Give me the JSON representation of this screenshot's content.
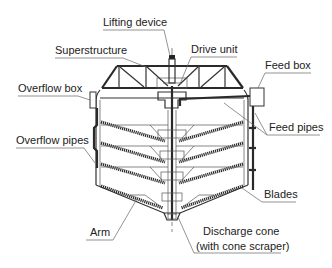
{
  "figure": {
    "labels": {
      "lifting_device": "Lifting device",
      "superstructure": "Superstructure",
      "drive_unit": "Drive unit",
      "feed_box": "Feed box",
      "overflow_box": "Overflow box",
      "feed_pipes": "Feed pipes",
      "overflow_pipes": "Overflow pipes",
      "blades": "Blades",
      "arm": "Arm",
      "discharge_cone_line1": "Discharge cone",
      "discharge_cone_line2": "(with cone scraper)"
    },
    "colors": {
      "line": "#2a2a2a",
      "leader": "#666666",
      "text": "#222222",
      "background": "#ffffff"
    }
  }
}
